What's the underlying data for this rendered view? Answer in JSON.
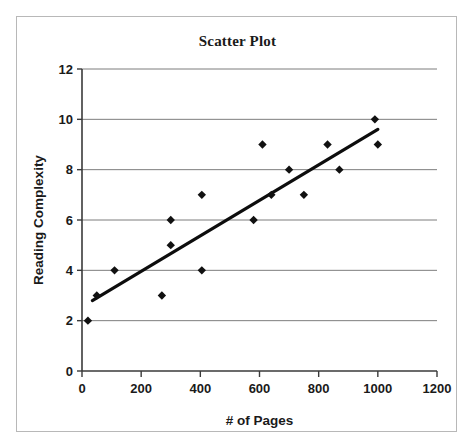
{
  "chart_data": {
    "type": "scatter",
    "title": "Scatter Plot",
    "xlabel": "# of Pages",
    "ylabel": "Reading Complexity",
    "xlim": [
      0,
      1200
    ],
    "ylim": [
      0,
      12
    ],
    "xticks": [
      0,
      200,
      400,
      600,
      800,
      1000,
      1200
    ],
    "yticks": [
      0,
      2,
      4,
      6,
      8,
      10,
      12
    ],
    "xtick_labels": [
      "0",
      "200",
      "400",
      "600",
      "800",
      "1000",
      "1200"
    ],
    "ytick_labels": [
      "0",
      "2",
      "4",
      "6",
      "8",
      "10",
      "12"
    ],
    "grid": "horizontal",
    "legend": "none",
    "marker": "diamond",
    "marker_color": "#111111",
    "points": [
      {
        "x": 20,
        "y": 2
      },
      {
        "x": 50,
        "y": 3
      },
      {
        "x": 110,
        "y": 4
      },
      {
        "x": 270,
        "y": 3
      },
      {
        "x": 300,
        "y": 5
      },
      {
        "x": 300,
        "y": 6
      },
      {
        "x": 405,
        "y": 4
      },
      {
        "x": 405,
        "y": 7
      },
      {
        "x": 580,
        "y": 6
      },
      {
        "x": 610,
        "y": 9
      },
      {
        "x": 640,
        "y": 7
      },
      {
        "x": 700,
        "y": 8
      },
      {
        "x": 750,
        "y": 7
      },
      {
        "x": 830,
        "y": 9
      },
      {
        "x": 870,
        "y": 8
      },
      {
        "x": 990,
        "y": 10
      },
      {
        "x": 1000,
        "y": 9
      }
    ],
    "trendline": {
      "visible": true,
      "color": "#0d0d0d",
      "x_start": 35,
      "y_start": 2.8,
      "x_end": 1000,
      "y_end": 9.6
    }
  }
}
